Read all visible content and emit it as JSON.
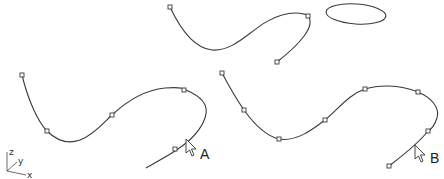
{
  "figure": {
    "labels": {
      "a": "A",
      "b": "B"
    },
    "axis_icon": {
      "z": "z",
      "y": "y",
      "x": "x"
    },
    "shapes": {
      "top_curve": {
        "control_points": [
          [
            170,
            7
          ],
          [
            308,
            16
          ],
          [
            277,
            62
          ]
        ]
      },
      "ellipse": {
        "cx": 356,
        "cy": 14,
        "rx": 30,
        "ry": 10
      },
      "curve_a": {
        "control_points": [
          [
            22,
            75
          ],
          [
            47,
            131
          ],
          [
            112,
            115
          ],
          [
            184,
            90
          ],
          [
            175,
            149
          ]
        ],
        "cursor": "pointer-arrow"
      },
      "curve_b": {
        "control_points": [
          [
            222,
            73
          ],
          [
            244,
            110
          ],
          [
            279,
            139
          ],
          [
            325,
            120
          ],
          [
            365,
            89
          ],
          [
            418,
            92
          ],
          [
            428,
            131
          ],
          [
            389,
            166
          ]
        ],
        "cursor": "pointer-arrow"
      }
    },
    "colors": {
      "stroke": "#3a3a3a",
      "background": "#ffffff"
    }
  }
}
